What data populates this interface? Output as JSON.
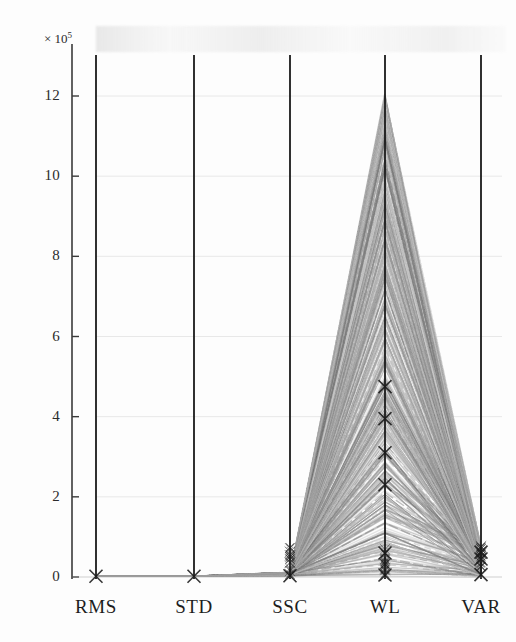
{
  "figure": {
    "kind": "parallel-coordinates-plot",
    "background_color": "#fdfdfd",
    "ink_color": "#1a1a1a",
    "line_color": "#8a8a8a",
    "grid_color": "#e8e8e8",
    "marker_glyph": "x"
  },
  "axis": {
    "multiplier_prefix": "× 10",
    "multiplier_exponent": "5",
    "y_label": "",
    "x_label": ""
  },
  "chart_data": {
    "type": "line",
    "subtype": "parallel-coordinates",
    "title": "",
    "xlabel": "",
    "ylabel": "",
    "y_multiplier": 100000,
    "y_multiplier_text": "× 10⁵",
    "ylim": [
      0,
      13.2
    ],
    "ytick_values": [
      0,
      2,
      4,
      6,
      8,
      10,
      12
    ],
    "ytick_labels": [
      "0",
      "2",
      "4",
      "6",
      "8",
      "10",
      "12"
    ],
    "grid": true,
    "grid_axis": "y",
    "legend": false,
    "legend_position": "none",
    "categories": [
      "RMS",
      "STD",
      "SSC",
      "WL",
      "VAR"
    ],
    "axis_count": 5,
    "marker": "x",
    "series": [
      {
        "name": "obs-001",
        "values": [
          0.02,
          0.02,
          0.03,
          11.9,
          0.1
        ]
      },
      {
        "name": "obs-002",
        "values": [
          0.02,
          0.02,
          0.03,
          11.6,
          0.12
        ]
      },
      {
        "name": "obs-003",
        "values": [
          0.02,
          0.02,
          0.03,
          11.3,
          0.09
        ]
      },
      {
        "name": "obs-004",
        "values": [
          0.02,
          0.02,
          0.03,
          11.0,
          0.14
        ]
      },
      {
        "name": "obs-005",
        "values": [
          0.02,
          0.02,
          0.03,
          10.7,
          0.11
        ]
      },
      {
        "name": "obs-006",
        "values": [
          0.02,
          0.02,
          0.03,
          10.4,
          0.16
        ]
      },
      {
        "name": "obs-007",
        "values": [
          0.02,
          0.02,
          0.03,
          10.1,
          0.1
        ]
      },
      {
        "name": "obs-008",
        "values": [
          0.02,
          0.02,
          0.03,
          9.8,
          0.18
        ]
      },
      {
        "name": "obs-009",
        "values": [
          0.02,
          0.02,
          0.03,
          9.5,
          0.12
        ]
      },
      {
        "name": "obs-010",
        "values": [
          0.02,
          0.02,
          0.03,
          9.2,
          0.2
        ]
      },
      {
        "name": "obs-011",
        "values": [
          0.02,
          0.02,
          0.03,
          8.9,
          0.13
        ]
      },
      {
        "name": "obs-012",
        "values": [
          0.02,
          0.02,
          0.03,
          8.6,
          0.22
        ]
      },
      {
        "name": "obs-013",
        "values": [
          0.02,
          0.02,
          0.03,
          8.3,
          0.15
        ]
      },
      {
        "name": "obs-014",
        "values": [
          0.02,
          0.02,
          0.03,
          8.0,
          0.24
        ]
      },
      {
        "name": "obs-015",
        "values": [
          0.02,
          0.02,
          0.03,
          7.7,
          0.17
        ]
      },
      {
        "name": "obs-016",
        "values": [
          0.02,
          0.02,
          0.04,
          7.4,
          0.26
        ]
      },
      {
        "name": "obs-017",
        "values": [
          0.02,
          0.02,
          0.04,
          7.1,
          0.19
        ]
      },
      {
        "name": "obs-018",
        "values": [
          0.02,
          0.02,
          0.04,
          6.8,
          0.28
        ]
      },
      {
        "name": "obs-019",
        "values": [
          0.02,
          0.02,
          0.04,
          6.5,
          0.21
        ]
      },
      {
        "name": "obs-020",
        "values": [
          0.02,
          0.02,
          0.04,
          6.2,
          0.3
        ]
      },
      {
        "name": "obs-021",
        "values": [
          0.02,
          0.02,
          0.04,
          5.9,
          0.23
        ]
      },
      {
        "name": "obs-022",
        "values": [
          0.02,
          0.02,
          0.04,
          5.6,
          0.33
        ]
      },
      {
        "name": "obs-023",
        "values": [
          0.02,
          0.02,
          0.04,
          5.3,
          0.25
        ]
      },
      {
        "name": "obs-024",
        "values": [
          0.02,
          0.02,
          0.05,
          5.0,
          0.36
        ]
      },
      {
        "name": "obs-025",
        "values": [
          0.02,
          0.02,
          0.05,
          4.8,
          0.28
        ]
      },
      {
        "name": "obs-026",
        "values": [
          0.02,
          0.02,
          0.05,
          4.6,
          0.4
        ]
      },
      {
        "name": "obs-027",
        "values": [
          0.02,
          0.02,
          0.05,
          4.4,
          0.31
        ]
      },
      {
        "name": "obs-028",
        "values": [
          0.02,
          0.02,
          0.05,
          4.2,
          0.44
        ]
      },
      {
        "name": "obs-029",
        "values": [
          0.02,
          0.02,
          0.05,
          4.0,
          0.34
        ]
      },
      {
        "name": "obs-030",
        "values": [
          0.02,
          0.02,
          0.06,
          3.8,
          0.48
        ]
      },
      {
        "name": "obs-031",
        "values": [
          0.02,
          0.02,
          0.06,
          3.6,
          0.37
        ]
      },
      {
        "name": "obs-032",
        "values": [
          0.02,
          0.02,
          0.06,
          3.4,
          0.52
        ]
      },
      {
        "name": "obs-033",
        "values": [
          0.02,
          0.02,
          0.06,
          3.2,
          0.4
        ]
      },
      {
        "name": "obs-034",
        "values": [
          0.02,
          0.02,
          0.06,
          3.0,
          0.56
        ]
      },
      {
        "name": "obs-035",
        "values": [
          0.02,
          0.02,
          0.07,
          2.8,
          0.43
        ]
      },
      {
        "name": "obs-036",
        "values": [
          0.02,
          0.02,
          0.07,
          2.6,
          0.6
        ]
      },
      {
        "name": "obs-037",
        "values": [
          0.02,
          0.02,
          0.07,
          2.4,
          0.46
        ]
      },
      {
        "name": "obs-038",
        "values": [
          0.02,
          0.02,
          0.07,
          2.2,
          0.64
        ]
      },
      {
        "name": "obs-039",
        "values": [
          0.02,
          0.02,
          0.08,
          2.0,
          0.5
        ]
      },
      {
        "name": "obs-040",
        "values": [
          0.02,
          0.02,
          0.08,
          1.85,
          0.68
        ]
      },
      {
        "name": "obs-041",
        "values": [
          0.02,
          0.02,
          0.08,
          1.7,
          0.54
        ]
      },
      {
        "name": "obs-042",
        "values": [
          0.02,
          0.02,
          0.08,
          1.55,
          0.58
        ]
      },
      {
        "name": "obs-043",
        "values": [
          0.02,
          0.02,
          0.08,
          1.4,
          0.45
        ]
      },
      {
        "name": "obs-044",
        "values": [
          0.02,
          0.02,
          0.08,
          1.25,
          0.38
        ]
      },
      {
        "name": "obs-045",
        "values": [
          0.02,
          0.02,
          0.07,
          1.1,
          0.32
        ]
      },
      {
        "name": "obs-046",
        "values": [
          0.02,
          0.02,
          0.07,
          0.95,
          0.27
        ]
      },
      {
        "name": "obs-047",
        "values": [
          0.02,
          0.02,
          0.07,
          0.8,
          0.22
        ]
      },
      {
        "name": "obs-048",
        "values": [
          0.02,
          0.02,
          0.06,
          0.65,
          0.18
        ]
      },
      {
        "name": "obs-049",
        "values": [
          0.02,
          0.02,
          0.06,
          0.5,
          0.14
        ]
      },
      {
        "name": "obs-050",
        "values": [
          0.02,
          0.02,
          0.05,
          0.35,
          0.1
        ]
      },
      {
        "name": "obs-051",
        "values": [
          0.02,
          0.02,
          0.04,
          0.22,
          0.07
        ]
      },
      {
        "name": "obs-052",
        "values": [
          0.02,
          0.02,
          0.03,
          0.12,
          0.05
        ]
      }
    ],
    "marked_points": {
      "RMS": [
        0.02
      ],
      "STD": [
        0.02
      ],
      "SSC": [
        0.03
      ],
      "WL": [
        4.75,
        3.95,
        3.1,
        2.3,
        0.6,
        0.05
      ],
      "VAR": [
        0.62,
        0.45,
        0.06
      ]
    }
  }
}
